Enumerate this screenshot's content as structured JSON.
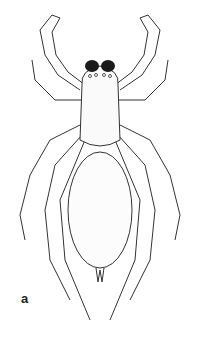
{
  "figure": {
    "panel_label": "a",
    "colors": {
      "ink": "#222222",
      "background": "#ffffff",
      "chelicerae": "#1a1a1a"
    }
  }
}
